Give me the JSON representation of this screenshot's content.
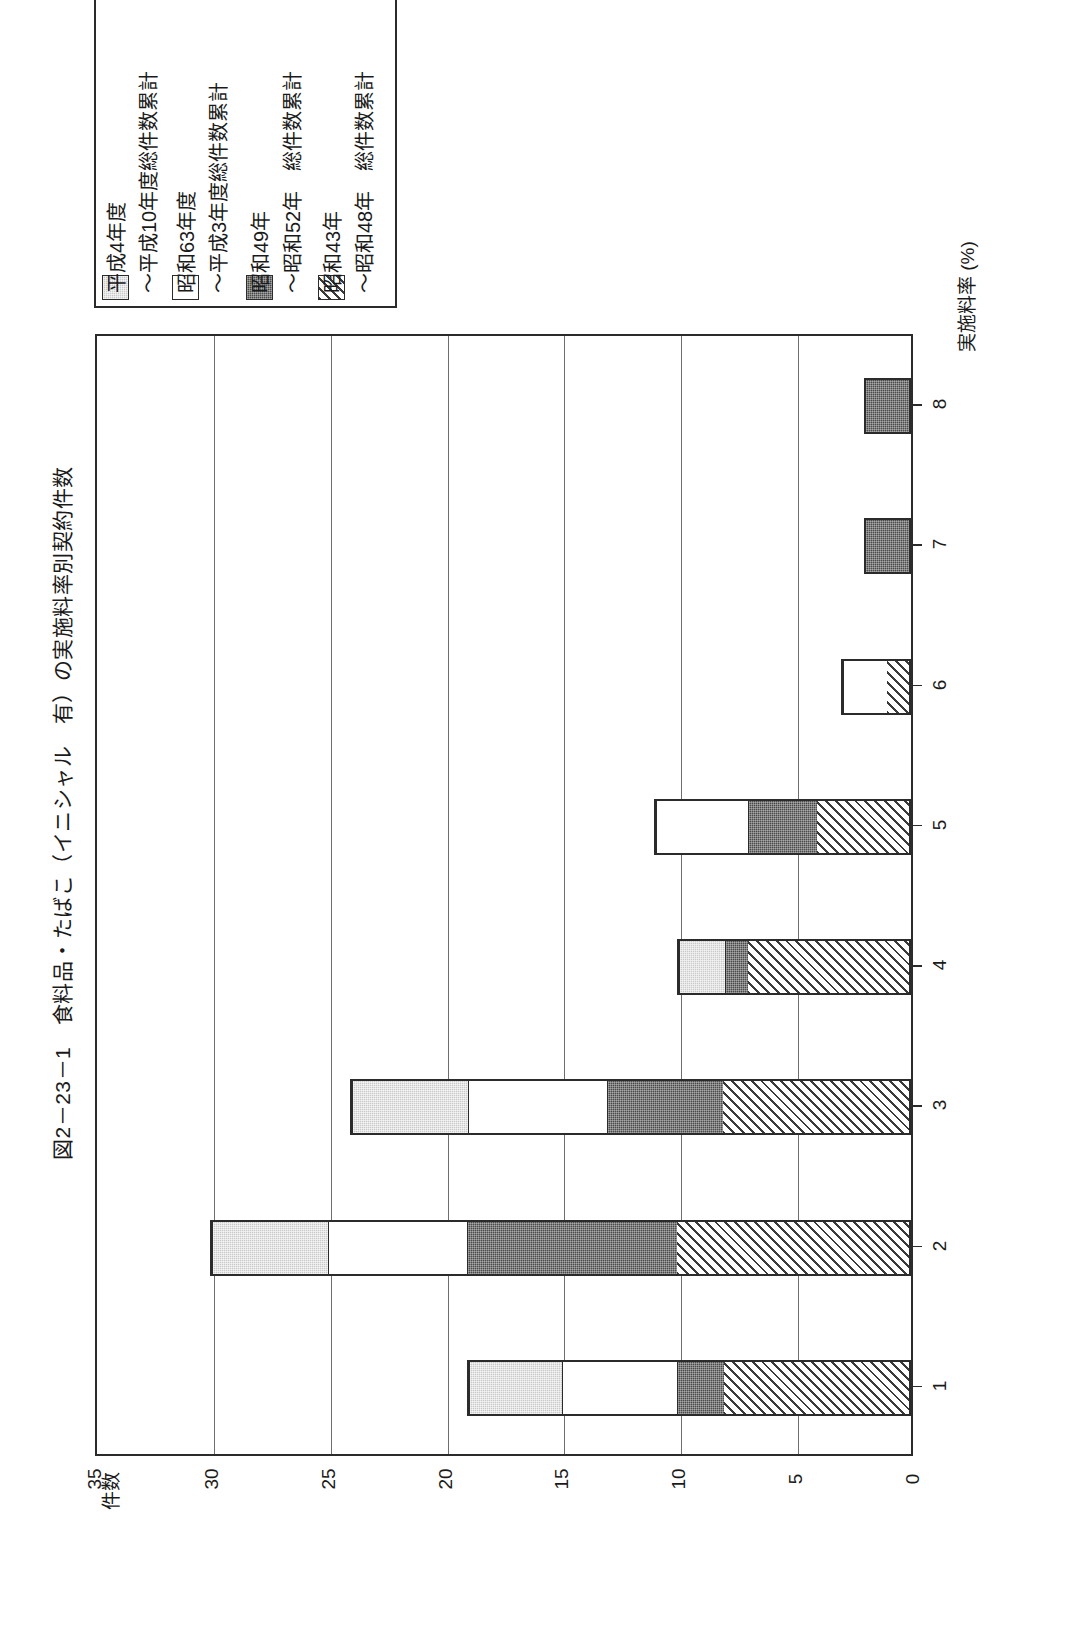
{
  "figure": {
    "title": "図2－23－1　食料品・たばこ（イニシャル　有）の実施料率別契約件数"
  },
  "legend": {
    "items": [
      {
        "label": "平成4年度",
        "swatch": "light-gray-dotted"
      },
      {
        "label": "～平成10年度総件数累計",
        "swatch": "white"
      },
      {
        "label": "昭和63年度",
        "swatch": ""
      },
      {
        "label": "～平成3年度総件数累計",
        "swatch": ""
      },
      {
        "label": "昭和49年",
        "swatch": "dark-dotted"
      },
      {
        "label": "～昭和52年　総件数累計",
        "swatch": ""
      },
      {
        "label": "昭和43年",
        "swatch": "diagonal-hatch"
      },
      {
        "label": "～昭和48年　総件数累計",
        "swatch": ""
      }
    ],
    "entries": [
      {
        "swatch": "light-gray-dotted",
        "line1": "平成4年度",
        "line2": "～平成10年度総件数累計"
      },
      {
        "swatch": "white",
        "line1": "昭和63年度",
        "line2": "～平成3年度総件数累計"
      },
      {
        "swatch": "dark-dotted",
        "line1": "昭和49年",
        "line2": "～昭和52年　総件数累計"
      },
      {
        "swatch": "diagonal-hatch",
        "line1": "昭和43年",
        "line2": "～昭和48年　総件数累計"
      }
    ]
  },
  "chart_data": {
    "type": "bar",
    "orientation": "horizontal",
    "stacked": true,
    "title": "図2－23－1　食料品・たばこ（イニシャル　有）の実施料率別契約件数",
    "xlabel": "実施料率 (%)",
    "ylabel": "件数",
    "categories": [
      "1",
      "2",
      "3",
      "4",
      "5",
      "6",
      "7",
      "8"
    ],
    "value_ticks": [
      "35",
      "30",
      "25",
      "20",
      "15",
      "10",
      "5",
      "0"
    ],
    "ylim": [
      0,
      35
    ],
    "grid": true,
    "legend_position": "top-left",
    "series": [
      {
        "name": "平成4年度～平成10年度総件数累計",
        "swatch": "light-gray-dotted",
        "values": [
          4,
          5,
          5,
          2,
          0,
          0,
          0,
          0
        ]
      },
      {
        "name": "昭和63年度～平成3年度総件数累計",
        "swatch": "white",
        "values": [
          5,
          6,
          6,
          0,
          4,
          2,
          0,
          0
        ]
      },
      {
        "name": "昭和49年～昭和52年　総件数累計",
        "swatch": "dark-dotted",
        "values": [
          2,
          9,
          5,
          1,
          3,
          0,
          2,
          2
        ]
      },
      {
        "name": "昭和43年～昭和48年　総件数累計",
        "swatch": "diagonal-hatch",
        "values": [
          8,
          10,
          8,
          7,
          4,
          1,
          0,
          0
        ]
      }
    ],
    "totals": [
      19,
      30,
      24,
      10,
      11,
      3,
      2,
      2
    ]
  },
  "axes": {
    "value_axis_title": "件数",
    "category_axis_title": "実施料率 (%)"
  }
}
